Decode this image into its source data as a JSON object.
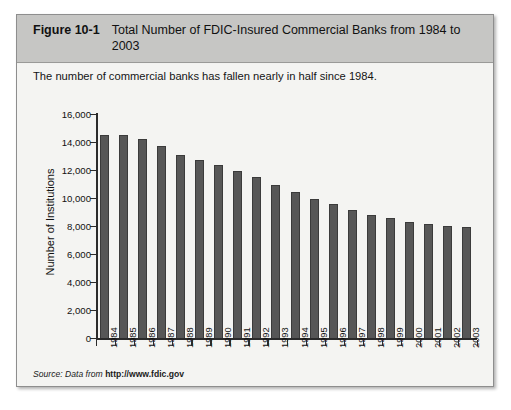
{
  "figure": {
    "label": "Figure 10-1",
    "title": "Total Number of FDIC-Insured Commercial Banks from 1984 to 2003",
    "caption": "The number of commercial banks has fallen nearly in half since 1984.",
    "source_prefix": "Source: Data from ",
    "source_url": "http://www.fdic.gov"
  },
  "chart_data": {
    "type": "bar",
    "title": "Total Number of FDIC-Insured Commercial Banks from 1984 to 2003",
    "xlabel": "",
    "ylabel": "Number of Institutions",
    "ylim": [
      0,
      16000
    ],
    "ytick_labels": [
      "16,000",
      "14,000",
      "12,000",
      "10,000",
      "8,000",
      "6,000",
      "4,000",
      "2,000",
      "0"
    ],
    "ytick_values": [
      16000,
      14000,
      12000,
      10000,
      8000,
      6000,
      4000,
      2000,
      0
    ],
    "grid": false,
    "legend": false,
    "bar_color": "#575757",
    "categories": [
      "1984",
      "1985",
      "1986",
      "1987",
      "1988",
      "1989",
      "1990",
      "1991",
      "1992",
      "1993",
      "1994",
      "1995",
      "1996",
      "1997",
      "1998",
      "1999",
      "2000",
      "2001",
      "2002",
      "2003"
    ],
    "values": [
      14500,
      14500,
      14200,
      13700,
      13100,
      12700,
      12350,
      11900,
      11500,
      10950,
      10450,
      9950,
      9550,
      9150,
      8800,
      8600,
      8300,
      8150,
      8000,
      7950
    ]
  },
  "colors": {
    "header_band": "#c6c6c4",
    "panel": "#f4f4f2",
    "bar": "#575757",
    "axis": "#2b2b2b"
  }
}
